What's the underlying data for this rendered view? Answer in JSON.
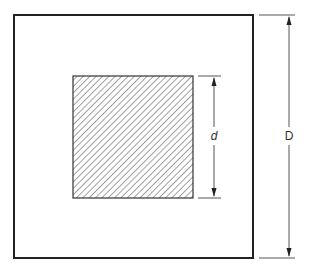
{
  "diagram": {
    "title": "",
    "outer_square": {
      "label": "D",
      "x": 14,
      "y": 15,
      "width": 239,
      "height": 243,
      "stroke": "#222222",
      "fill": "#ffffff"
    },
    "inner_square": {
      "label": "d",
      "x": 73,
      "y": 76,
      "width": 120,
      "height": 122,
      "stroke": "#333333",
      "hatch_color": "#555555",
      "hatch": "diagonal-45"
    },
    "dimensions": [
      {
        "name": "d",
        "label": "d",
        "italic": true,
        "measures": "inner square side"
      },
      {
        "name": "D",
        "label": "D",
        "italic": false,
        "measures": "outer square side"
      }
    ]
  }
}
